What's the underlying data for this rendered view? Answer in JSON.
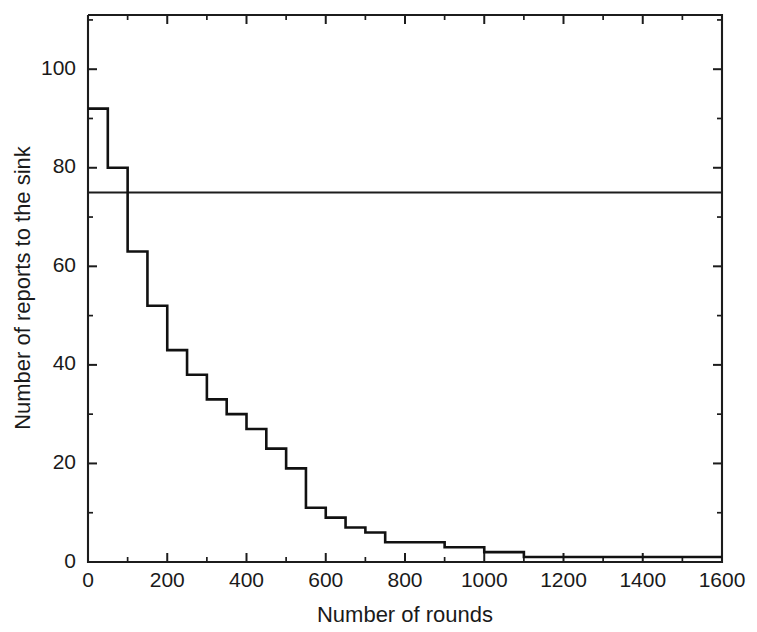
{
  "chart_data": {
    "type": "line",
    "subtype": "step-post",
    "title": "",
    "xlabel": "Number of rounds",
    "ylabel": "Number of reports to the sink",
    "xlim": [
      0,
      1600
    ],
    "ylim": [
      0,
      111
    ],
    "grid": false,
    "legend": false,
    "legend_position": "none",
    "x_major_ticks": [
      0,
      200,
      400,
      600,
      800,
      1000,
      1200,
      1400,
      1600
    ],
    "x_major_tick_labels": [
      "0",
      "200",
      "400",
      "600",
      "800",
      "1000",
      "1200",
      "1400",
      "1600"
    ],
    "x_minor_ticks": [
      100,
      300,
      500,
      700,
      900,
      1100,
      1300,
      1500
    ],
    "y_major_ticks": [
      0,
      20,
      40,
      60,
      80,
      100
    ],
    "y_major_tick_labels": [
      "0",
      "20",
      "40",
      "60",
      "80",
      "100"
    ],
    "y_minor_ticks": [
      10,
      30,
      50,
      70,
      90,
      110
    ],
    "tick_direction": "in",
    "series": [
      {
        "name": "reports-to-sink-step",
        "style": "step",
        "color": "#111111",
        "x": [
          0,
          50,
          100,
          150,
          200,
          250,
          300,
          350,
          400,
          450,
          500,
          550,
          600,
          650,
          700,
          750,
          800,
          850,
          900,
          950,
          1000,
          1050,
          1100,
          1150,
          1200,
          1250,
          1300,
          1350,
          1400,
          1450,
          1500,
          1550,
          1600
        ],
        "values": [
          92,
          80,
          63,
          52,
          43,
          38,
          33,
          30,
          27,
          23,
          19,
          11,
          9,
          7,
          6,
          4,
          4,
          4,
          3,
          3,
          2,
          2,
          1,
          1,
          1,
          1,
          1,
          1,
          1,
          1,
          1,
          1,
          1
        ]
      }
    ],
    "annotations": [
      {
        "name": "reference-line",
        "type": "hline",
        "y": 75,
        "color": "#1c1c1c",
        "label": ""
      }
    ]
  },
  "axes": {
    "x_title": "Number of rounds",
    "y_title": "Number of reports to the sink"
  }
}
